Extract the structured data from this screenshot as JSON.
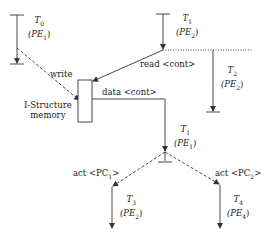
{
  "diagram": {
    "memory": {
      "label_line1": "I-Structure",
      "label_line2": "memory"
    },
    "threads": [
      {
        "id": "T0",
        "name": "T",
        "sub": "0",
        "pe": "(PE",
        "pe_sub": "1",
        "pe_close": ")"
      },
      {
        "id": "T1a",
        "name": "T",
        "sub": "1",
        "pe": "(PE",
        "pe_sub": "2",
        "pe_close": ")"
      },
      {
        "id": "T2",
        "name": "T",
        "sub": "2",
        "pe": "(PE",
        "pe_sub": "2",
        "pe_close": ")"
      },
      {
        "id": "T1b",
        "name": "T",
        "sub": "1",
        "pe": "(PE",
        "pe_sub": "1",
        "pe_close": ")"
      },
      {
        "id": "T3",
        "name": "T",
        "sub": "3",
        "pe": "(PE",
        "pe_sub": "2",
        "pe_close": ")"
      },
      {
        "id": "T4",
        "name": "T",
        "sub": "4",
        "pe": "(PE",
        "pe_sub": "4",
        "pe_close": ")"
      }
    ],
    "edges": {
      "write": "write",
      "read": "read <cont>",
      "data": "data <cont>",
      "act1_pre": "act <PC",
      "act1_sub": "1",
      "act1_post": ">",
      "act2_pre": "act <PC",
      "act2_sub": "2",
      "act2_post": ">"
    },
    "colors": {
      "line": "#333333"
    }
  }
}
